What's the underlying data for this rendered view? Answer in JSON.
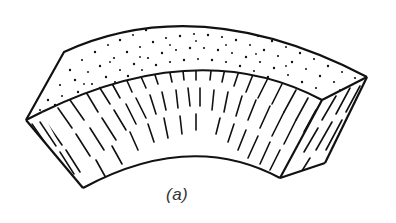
{
  "figure": {
    "caption": "(a)",
    "colors": {
      "background": "#ffffff",
      "stroke": "#111111",
      "caption": "#333333"
    },
    "faces": [
      {
        "name": "top-face",
        "texture": "stipple"
      },
      {
        "name": "front-face",
        "texture": "hatch"
      },
      {
        "name": "right-side-face",
        "texture": "hatch"
      },
      {
        "name": "left-side-face",
        "texture": "hatch"
      }
    ]
  }
}
